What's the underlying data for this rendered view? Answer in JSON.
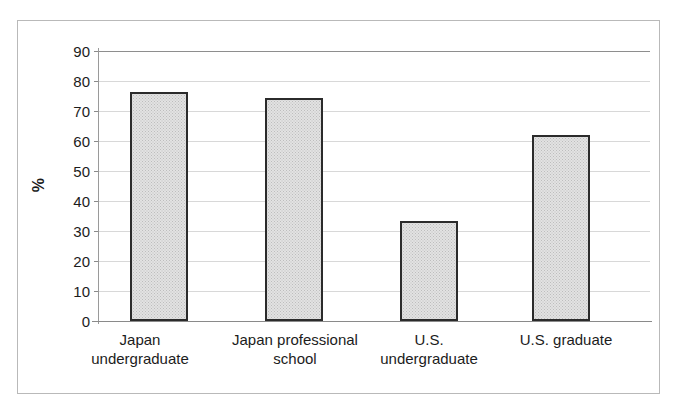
{
  "chart_data": {
    "type": "bar",
    "title": "",
    "subtitle": "",
    "xlabel": "",
    "ylabel": "%",
    "ylim": [
      0,
      90
    ],
    "ytick_step": 10,
    "yticks": [
      90,
      80,
      70,
      60,
      50,
      40,
      30,
      20,
      10,
      0
    ],
    "grid": true,
    "legend": false,
    "legend_position": "none",
    "categories": [
      "Japan undergraduate",
      "Japan professional school",
      "U.S. undergraduate",
      "U.S. graduate"
    ],
    "category_lines": [
      [
        "Japan",
        "undergraduate"
      ],
      [
        "Japan professional",
        "school"
      ],
      [
        "U.S.",
        "undergraduate"
      ],
      [
        "U.S. graduate"
      ]
    ],
    "values": [
      76.4,
      74.5,
      33.3,
      62.0
    ],
    "series": [
      {
        "name": "",
        "values": [
          76.4,
          74.5,
          33.3,
          62.0
        ]
      }
    ],
    "bar_fill_color": "#e2e2e2",
    "bar_border_color": "#2b2b2b",
    "gridline_color": "#d8d8d8",
    "axis_color": "#8a8a8a",
    "frame_color": "#b9b9b9",
    "background_color": "#ffffff"
  },
  "axis": {
    "y_title": "%",
    "y_tick_labels": [
      "90",
      "80",
      "70",
      "60",
      "50",
      "40",
      "30",
      "20",
      "10",
      "0"
    ]
  },
  "bars": [
    {
      "label_line1": "Japan",
      "label_line2": "undergraduate",
      "value": 76.4
    },
    {
      "label_line1": "Japan professional",
      "label_line2": "school",
      "value": 74.5
    },
    {
      "label_line1": "U.S.",
      "label_line2": "undergraduate",
      "value": 33.3
    },
    {
      "label_line1": "U.S. graduate",
      "label_line2": "",
      "value": 62.0
    }
  ]
}
